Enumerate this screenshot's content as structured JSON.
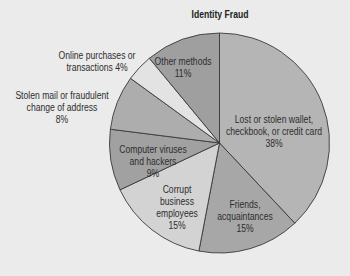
{
  "chart_data": {
    "type": "pie",
    "title": "Identity Fraud",
    "categories": [
      "Lost or stolen wallet, checkbook, or credit card",
      "Friends, acquaintances",
      "Corrupt business employees",
      "Computer viruses and hackers",
      "Stolen mail or fraudulent change of address",
      "Online purchases or transactions",
      "Other methods"
    ],
    "values": [
      38,
      15,
      15,
      9,
      8,
      4,
      11
    ],
    "unit": "%",
    "start_angle": "12 o'clock, clockwise",
    "legend": "none (inline labels)",
    "colors": [
      "#b5b5b5",
      "#a7a7a7",
      "#d3d3d3",
      "#a1a1a1",
      "#adadad",
      "#e3e3e3",
      "#9f9f9f"
    ]
  },
  "labels": {
    "lost_wallet": [
      "Lost or stolen wallet,",
      "checkbook, or credit card",
      "38%"
    ],
    "friends": [
      "Friends,",
      "acquaintances",
      "15%"
    ],
    "corrupt": [
      "Corrupt",
      "business",
      "employees",
      "15%"
    ],
    "computer": [
      "Computer viruses",
      "and hackers",
      "9%"
    ],
    "stolen_mail": [
      "Stolen mail or fraudulent",
      "change of address",
      "8%"
    ],
    "online": [
      "Online purchases or",
      "transactions 4%"
    ],
    "other": [
      "Other methods",
      "11%"
    ]
  }
}
